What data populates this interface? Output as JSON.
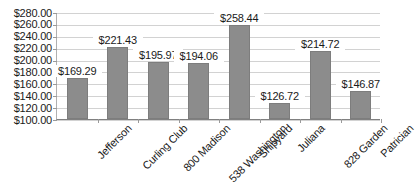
{
  "chart_data": {
    "type": "bar",
    "title": "",
    "subtitle": "",
    "xlabel": "",
    "ylabel": "",
    "categories": [
      "Jefferson",
      "Curling Club",
      "800 Madison",
      "538 Washington",
      "Shipyard",
      "Juliana",
      "828 Garden",
      "Patrician"
    ],
    "values": [
      169.29,
      221.43,
      195.97,
      194.06,
      258.44,
      126.72,
      214.72,
      146.87
    ],
    "value_labels": [
      "$169.29",
      "$221.43",
      "$195.97",
      "$194.06",
      "$258.44",
      "$126.72",
      "$214.72",
      "$146.87"
    ],
    "ylim": [
      100,
      280
    ],
    "ytick_values": [
      100,
      120,
      140,
      160,
      180,
      200,
      220,
      240,
      260,
      280
    ],
    "ytick_labels": [
      "$100.00",
      "$120.00",
      "$140.00",
      "$160.00",
      "$180.00",
      "$200.00",
      "$220.00",
      "$240.00",
      "$260.00",
      "$280.00"
    ],
    "grid": true,
    "legend": false,
    "legend_position": "none",
    "bar_color": "#8c8c8c",
    "bar_border_color": "#7d7d7d",
    "gridline_color": "#d2d2d2",
    "axis_color": "#808080",
    "background_color": "#ffffff",
    "text_color": "#1a1a1a"
  }
}
